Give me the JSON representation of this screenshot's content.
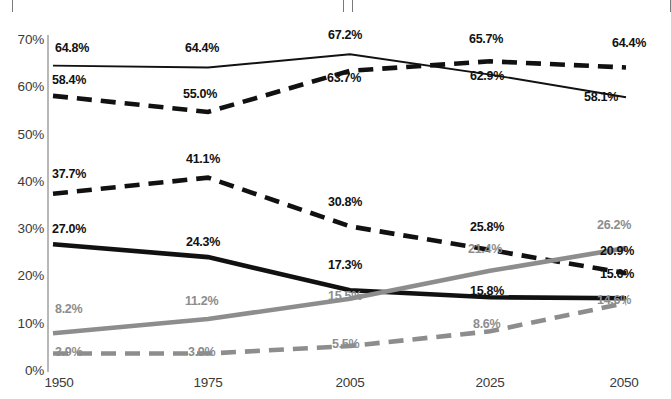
{
  "top_panels": [
    {
      "name": "panel-left"
    },
    {
      "name": "panel-right"
    }
  ],
  "chart_data": {
    "type": "line",
    "title": "",
    "subtitle": "",
    "xlabel": "",
    "ylabel": "",
    "categories": [
      "1950",
      "1975",
      "2005",
      "2025",
      "2050"
    ],
    "x_tick_labels": [
      "1950",
      "1975",
      "2005",
      "2025",
      "2050"
    ],
    "y_tick_labels": [
      "0%",
      "10%",
      "20%",
      "30%",
      "40%",
      "50%",
      "60%",
      "70%"
    ],
    "y_ticks": [
      0,
      10,
      20,
      30,
      40,
      50,
      60,
      70
    ],
    "ylim": [
      0,
      70
    ],
    "grid": false,
    "legend": "none",
    "value_suffix": "%",
    "series": [
      {
        "name": "series-1-thin-solid-black",
        "style": "solid",
        "width": "thin",
        "color": "#111111",
        "label_color": "dark",
        "values": [
          64.8,
          64.4,
          67.2,
          62.9,
          58.1
        ],
        "labels": [
          "64.8%",
          "64.4%",
          "67.2%",
          "62.9%",
          "58.1%"
        ]
      },
      {
        "name": "series-2-thick-dashed-black",
        "style": "dashed",
        "width": "thick",
        "color": "#111111",
        "label_color": "dark",
        "values": [
          58.4,
          55.0,
          63.7,
          65.7,
          64.4
        ],
        "labels": [
          "58.4%",
          "55.0%",
          "63.7%",
          "65.7%",
          "64.4%"
        ]
      },
      {
        "name": "series-3-thick-dashed-black-lower",
        "style": "dashed",
        "width": "thick",
        "color": "#111111",
        "label_color": "dark",
        "values": [
          37.7,
          41.1,
          30.8,
          25.8,
          20.9
        ],
        "labels": [
          "37.7%",
          "41.1%",
          "30.8%",
          "25.8%",
          "20.9%"
        ]
      },
      {
        "name": "series-4-thick-solid-black",
        "style": "solid",
        "width": "thick",
        "color": "#111111",
        "label_color": "dark",
        "values": [
          27.0,
          24.3,
          17.3,
          15.8,
          15.6
        ],
        "labels": [
          "27.0%",
          "24.3%",
          "17.3%",
          "15.8%",
          "15.6%"
        ]
      },
      {
        "name": "series-5-thick-solid-grey",
        "style": "solid",
        "width": "thick",
        "color": "#8d8d8d",
        "label_color": "grey",
        "values": [
          8.2,
          11.2,
          15.5,
          21.4,
          26.2
        ],
        "labels": [
          "8.2%",
          "11.2%",
          "15.5%",
          "21.4%",
          "26.2%"
        ]
      },
      {
        "name": "series-6-thick-dashed-grey",
        "style": "dashed",
        "width": "thick",
        "color": "#8d8d8d",
        "label_color": "grey",
        "values": [
          3.9,
          3.9,
          5.5,
          8.6,
          14.6
        ],
        "labels": [
          "3.9%",
          "3.9%",
          "5.5%",
          "8.6%",
          "14.6%"
        ]
      }
    ],
    "point_label_positions": [
      {
        "series": 0,
        "i": 0,
        "text": "64.8%",
        "x": 55,
        "y": 42,
        "anchor": "start",
        "color": "dark"
      },
      {
        "series": 0,
        "i": 1,
        "text": "64.4%",
        "x": 185,
        "y": 42,
        "anchor": "start",
        "color": "dark"
      },
      {
        "series": 0,
        "i": 2,
        "text": "67.2%",
        "x": 328,
        "y": 29,
        "anchor": "start",
        "color": "dark"
      },
      {
        "series": 0,
        "i": 3,
        "text": "62.9%",
        "x": 470,
        "y": 70,
        "anchor": "start",
        "color": "dark"
      },
      {
        "series": 0,
        "i": 4,
        "text": "58.1%",
        "x": 584,
        "y": 91,
        "anchor": "start",
        "color": "dark"
      },
      {
        "series": 1,
        "i": 0,
        "text": "58.4%",
        "x": 52,
        "y": 74,
        "anchor": "start",
        "color": "dark"
      },
      {
        "series": 1,
        "i": 1,
        "text": "55.0%",
        "x": 183,
        "y": 88,
        "anchor": "start",
        "color": "dark"
      },
      {
        "series": 1,
        "i": 2,
        "text": "63.7%",
        "x": 327,
        "y": 72,
        "anchor": "start",
        "color": "dark"
      },
      {
        "series": 1,
        "i": 3,
        "text": "65.7%",
        "x": 469,
        "y": 33,
        "anchor": "start",
        "color": "dark"
      },
      {
        "series": 1,
        "i": 4,
        "text": "64.4%",
        "x": 612,
        "y": 37,
        "anchor": "start",
        "color": "dark"
      },
      {
        "series": 2,
        "i": 0,
        "text": "37.7%",
        "x": 52,
        "y": 168,
        "anchor": "start",
        "color": "dark"
      },
      {
        "series": 2,
        "i": 1,
        "text": "41.1%",
        "x": 186,
        "y": 153,
        "anchor": "start",
        "color": "dark"
      },
      {
        "series": 2,
        "i": 2,
        "text": "30.8%",
        "x": 328,
        "y": 196,
        "anchor": "start",
        "color": "dark"
      },
      {
        "series": 2,
        "i": 3,
        "text": "25.8%",
        "x": 470,
        "y": 221,
        "anchor": "start",
        "color": "dark"
      },
      {
        "series": 2,
        "i": 4,
        "text": "20.9%",
        "x": 600,
        "y": 245,
        "anchor": "start",
        "color": "dark"
      },
      {
        "series": 3,
        "i": 0,
        "text": "27.0%",
        "x": 52,
        "y": 223,
        "anchor": "start",
        "color": "dark"
      },
      {
        "series": 3,
        "i": 1,
        "text": "24.3%",
        "x": 186,
        "y": 236,
        "anchor": "start",
        "color": "dark"
      },
      {
        "series": 3,
        "i": 2,
        "text": "17.3%",
        "x": 328,
        "y": 259,
        "anchor": "start",
        "color": "dark"
      },
      {
        "series": 3,
        "i": 3,
        "text": "15.8%",
        "x": 470,
        "y": 285,
        "anchor": "start",
        "color": "dark"
      },
      {
        "series": 3,
        "i": 4,
        "text": "15.6%",
        "x": 600,
        "y": 268,
        "anchor": "start",
        "color": "dark"
      },
      {
        "series": 4,
        "i": 0,
        "text": "8.2%",
        "x": 55,
        "y": 303,
        "anchor": "start",
        "color": "grey"
      },
      {
        "series": 4,
        "i": 1,
        "text": "11.2%",
        "x": 185,
        "y": 295,
        "anchor": "start",
        "color": "grey"
      },
      {
        "series": 4,
        "i": 2,
        "text": "15.5%",
        "x": 328,
        "y": 290,
        "anchor": "start",
        "color": "grey"
      },
      {
        "series": 4,
        "i": 3,
        "text": "21.4%",
        "x": 468,
        "y": 243,
        "anchor": "start",
        "color": "grey"
      },
      {
        "series": 4,
        "i": 4,
        "text": "26.2%",
        "x": 597,
        "y": 219,
        "anchor": "start",
        "color": "grey"
      },
      {
        "series": 5,
        "i": 0,
        "text": "3.9%",
        "x": 55,
        "y": 346,
        "anchor": "start",
        "color": "grey"
      },
      {
        "series": 5,
        "i": 1,
        "text": "3.9%",
        "x": 188,
        "y": 346,
        "anchor": "start",
        "color": "grey"
      },
      {
        "series": 5,
        "i": 2,
        "text": "5.5%",
        "x": 332,
        "y": 338,
        "anchor": "start",
        "color": "grey"
      },
      {
        "series": 5,
        "i": 3,
        "text": "8.6%",
        "x": 473,
        "y": 318,
        "anchor": "start",
        "color": "grey"
      },
      {
        "series": 5,
        "i": 4,
        "text": "14.6%",
        "x": 597,
        "y": 294,
        "anchor": "start",
        "color": "grey"
      }
    ]
  }
}
